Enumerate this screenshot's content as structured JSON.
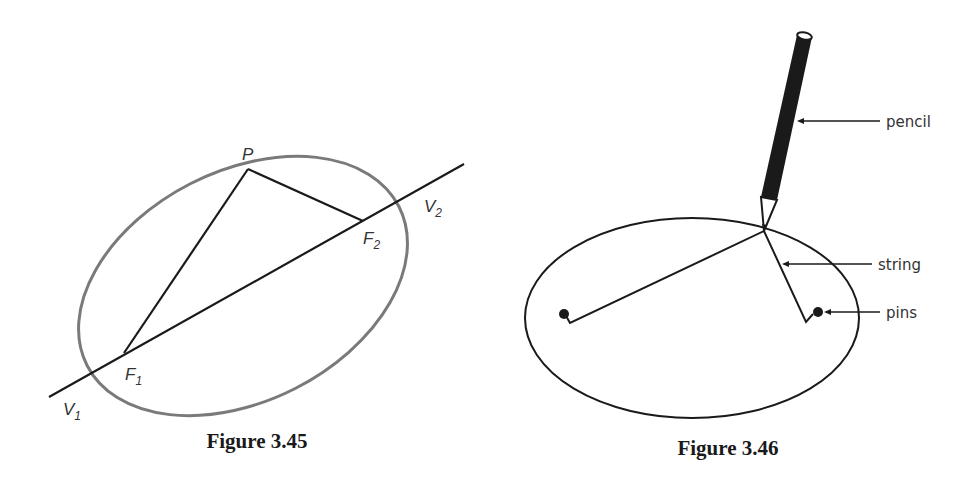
{
  "figures": [
    {
      "caption": "Figure 3.45",
      "labels": {
        "P": {
          "main": "P",
          "sub": ""
        },
        "F1": {
          "main": "F",
          "sub": "1"
        },
        "F2": {
          "main": "F",
          "sub": "2"
        },
        "V1": {
          "main": "V",
          "sub": "1"
        },
        "V2": {
          "main": "V",
          "sub": "2"
        }
      },
      "colors": {
        "ellipse": "#7a7a7a",
        "lines": "#1a1a1a"
      }
    },
    {
      "caption": "Figure 3.46",
      "callouts": {
        "pencil": "pencil",
        "string": "string",
        "pins": "pins"
      },
      "colors": {
        "ellipse": "#1a1a1a",
        "pencil": "#1a1a1a"
      }
    }
  ]
}
